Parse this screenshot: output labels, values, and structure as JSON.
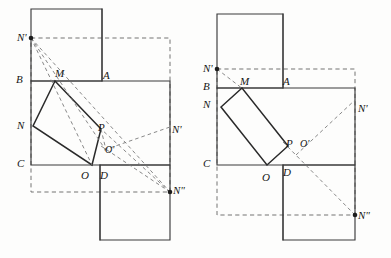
{
  "figure": {
    "type": "geometry-diagram",
    "width": 391,
    "height": 258,
    "background_color": "#fdfdfc",
    "solid_stroke_color": "#3b3b3b",
    "dashed_stroke_color": "#6d6d6d",
    "vertex_color": "#1d1d1d"
  },
  "diagrams": [
    {
      "id": "left-diagram",
      "name": "left-construction",
      "labels": [
        {
          "key": "n_prime_top",
          "text": "N'",
          "x": 17,
          "y": 32,
          "size": "normal"
        },
        {
          "key": "b",
          "text": "B",
          "x": 16,
          "y": 74,
          "size": "normal"
        },
        {
          "key": "m",
          "text": "M",
          "x": 55,
          "y": 68,
          "size": "normal"
        },
        {
          "key": "a",
          "text": "A",
          "x": 103,
          "y": 70,
          "size": "normal"
        },
        {
          "key": "n_left",
          "text": "N",
          "x": 17,
          "y": 120,
          "size": "normal"
        },
        {
          "key": "p",
          "text": "P",
          "x": 98,
          "y": 122,
          "size": "normal"
        },
        {
          "key": "n_prime_right",
          "text": "N'",
          "x": 172,
          "y": 124,
          "size": "normal"
        },
        {
          "key": "o_prime",
          "text": "O'",
          "x": 105,
          "y": 145,
          "size": "small"
        },
        {
          "key": "c",
          "text": "C",
          "x": 17,
          "y": 158,
          "size": "normal"
        },
        {
          "key": "o",
          "text": "O",
          "x": 81,
          "y": 170,
          "size": "normal"
        },
        {
          "key": "d",
          "text": "D",
          "x": 100,
          "y": 170,
          "size": "normal"
        },
        {
          "key": "n_double",
          "text": "N\"",
          "x": 173,
          "y": 185,
          "size": "normal"
        }
      ],
      "vertices": [
        {
          "key": "n_prime_top_dot",
          "x": 31,
          "y": 38
        },
        {
          "key": "n_double_dot",
          "x": 170,
          "y": 192
        }
      ]
    },
    {
      "id": "right-diagram",
      "name": "right-construction",
      "labels": [
        {
          "key": "n_prime_top",
          "text": "N'",
          "x": 203,
          "y": 63,
          "size": "normal"
        },
        {
          "key": "b",
          "text": "B",
          "x": 203,
          "y": 81,
          "size": "normal"
        },
        {
          "key": "m",
          "text": "M",
          "x": 240,
          "y": 76,
          "size": "normal"
        },
        {
          "key": "a",
          "text": "A",
          "x": 283,
          "y": 76,
          "size": "normal"
        },
        {
          "key": "n_left",
          "text": "N",
          "x": 203,
          "y": 99,
          "size": "normal"
        },
        {
          "key": "n_prime_right",
          "text": "N'",
          "x": 358,
          "y": 103,
          "size": "normal"
        },
        {
          "key": "p",
          "text": "P",
          "x": 286,
          "y": 138,
          "size": "normal"
        },
        {
          "key": "o_prime",
          "text": "O'",
          "x": 300,
          "y": 139,
          "size": "small"
        },
        {
          "key": "c",
          "text": "C",
          "x": 203,
          "y": 158,
          "size": "normal"
        },
        {
          "key": "o",
          "text": "O",
          "x": 262,
          "y": 172,
          "size": "normal"
        },
        {
          "key": "d",
          "text": "D",
          "x": 283,
          "y": 167,
          "size": "normal"
        },
        {
          "key": "n_double",
          "text": "N\"",
          "x": 358,
          "y": 210,
          "size": "normal"
        }
      ],
      "vertices": [
        {
          "key": "n_prime_top_dot",
          "x": 217,
          "y": 69
        },
        {
          "key": "n_double_dot",
          "x": 355,
          "y": 215
        }
      ]
    }
  ]
}
